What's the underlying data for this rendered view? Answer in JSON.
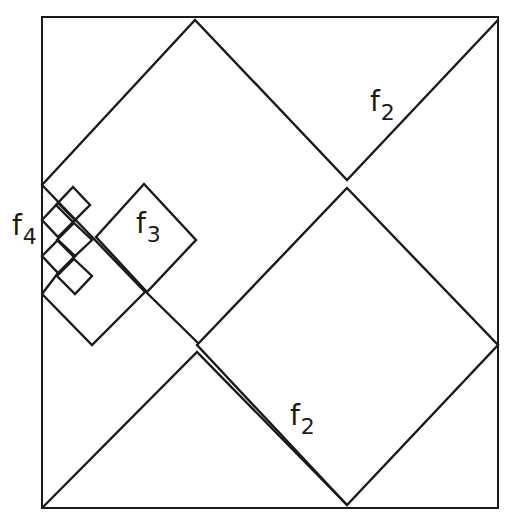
{
  "diagram": {
    "type": "nested-diamond-tiling",
    "frame": {
      "x": 42,
      "y": 17,
      "width": 456,
      "height": 491
    },
    "labels": [
      {
        "id": "f2-top",
        "base": "f",
        "sub": "2",
        "x": 370,
        "y": 90
      },
      {
        "id": "f2-bottom",
        "base": "f",
        "sub": "2",
        "x": 290,
        "y": 405
      },
      {
        "id": "f3",
        "base": "f",
        "sub": "3",
        "x": 138,
        "y": 212
      },
      {
        "id": "f4",
        "base": "f",
        "sub": "4",
        "x": 12,
        "y": 212
      }
    ],
    "stroke_color": "#1a1a1a",
    "background": "#ffffff"
  }
}
